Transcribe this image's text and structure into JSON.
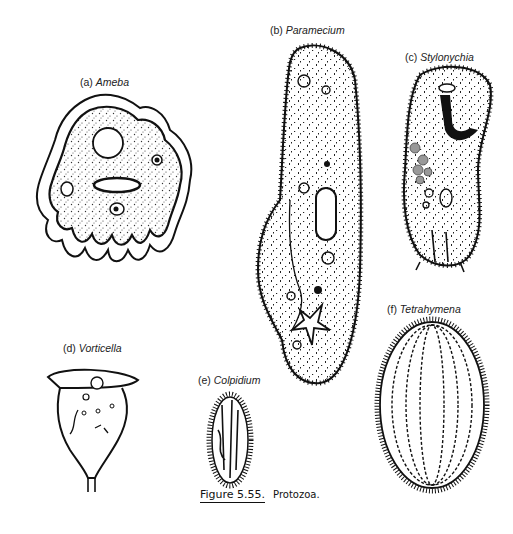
{
  "figure": {
    "number": "Figure 5.55.",
    "title": "Protozoa.",
    "panels": [
      {
        "letter": "(a)",
        "name": "Ameba"
      },
      {
        "letter": "(b)",
        "name": "Paramecium"
      },
      {
        "letter": "(c)",
        "name": "Stylonychia"
      },
      {
        "letter": "(d)",
        "name": "Vorticella"
      },
      {
        "letter": "(e)",
        "name": "Colpidium"
      },
      {
        "letter": "(f)",
        "name": "Tetrahymena"
      }
    ]
  }
}
